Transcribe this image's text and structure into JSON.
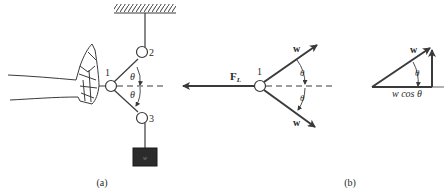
{
  "figure": {
    "panel_a": {
      "caption": "(a)",
      "pulley_labels": [
        "1",
        "2",
        "3"
      ],
      "angle_labels": [
        "θ",
        "θ"
      ],
      "weight_label": "w"
    },
    "panel_b": {
      "caption": "(b)",
      "free_body": {
        "node_label": "1",
        "force_label_main": "F",
        "force_label_sub": "L",
        "vector_labels": [
          "w",
          "w"
        ],
        "angle_labels": [
          "θ",
          "θ"
        ]
      },
      "triangle": {
        "hypotenuse_label": "w",
        "angle_label": "θ",
        "base_label": "w cos θ"
      }
    }
  },
  "colors": {
    "line": "#3a3a3a",
    "text": "#2a2a2a",
    "weight_box": "#2b2b2b"
  }
}
